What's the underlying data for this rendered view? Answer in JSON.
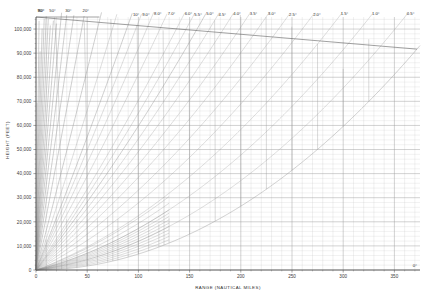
{
  "chart_data": {
    "type": "line",
    "title": "",
    "xlabel": "RANGE (NAUTICAL MILES)",
    "ylabel": "HEIGHT (FEET)",
    "xlim": [
      0,
      375
    ],
    "ylim": [
      0,
      105000
    ],
    "grid": true,
    "legend": "none",
    "xticks": [
      0,
      50,
      100,
      150,
      200,
      250,
      300,
      350
    ],
    "xticklabels": [
      "0",
      "50",
      "100",
      "150",
      "200",
      "250",
      "300",
      "350"
    ],
    "yticks": [
      0,
      10000,
      20000,
      30000,
      40000,
      50000,
      60000,
      70000,
      80000,
      90000,
      100000
    ],
    "yticklabels": [
      "0",
      "10,000",
      "20,000",
      "30,000",
      "40,000",
      "50,000",
      "60,000",
      "70,000",
      "80,000",
      "90,000",
      "100,000"
    ],
    "x_minor_step": 10,
    "y_minor_step": 2000,
    "elevation_angle_unit": "degrees",
    "elevation_rays_deg": [
      0,
      0.5,
      1.0,
      1.5,
      2.0,
      2.5,
      3.0,
      3.5,
      4.0,
      4.5,
      5.0,
      5.5,
      6.0,
      7.0,
      8.0,
      9.0,
      10.0,
      12.0,
      15.0,
      20.0,
      25.0,
      30.0,
      35.0,
      40.0,
      45.0,
      50.0,
      55.0,
      60.0,
      65.0,
      70.0,
      75.0,
      80.0,
      85.0,
      90.0
    ],
    "labeled_angles": [
      {
        "deg": 90,
        "label": "90°"
      },
      {
        "deg": 80,
        "label": "80°"
      },
      {
        "deg": 50,
        "label": "50°"
      },
      {
        "deg": 30,
        "label": "30°"
      },
      {
        "deg": 20,
        "label": "20°"
      },
      {
        "deg": 10,
        "label": "10°"
      },
      {
        "deg": 9,
        "label": "9.0°"
      },
      {
        "deg": 8,
        "label": "8.0°"
      },
      {
        "deg": 7,
        "label": "7.0°"
      },
      {
        "deg": 6,
        "label": "6.0°"
      },
      {
        "deg": 5.5,
        "label": "5.5°"
      },
      {
        "deg": 5,
        "label": "5.0°"
      },
      {
        "deg": 4.5,
        "label": "4.5°"
      },
      {
        "deg": 4,
        "label": "4.0°"
      },
      {
        "deg": 3.5,
        "label": "3.5°"
      },
      {
        "deg": 3,
        "label": "3.0°"
      },
      {
        "deg": 2.5,
        "label": "2.5°"
      },
      {
        "deg": 2,
        "label": "2.0°"
      },
      {
        "deg": 1.5,
        "label": "1.5°"
      },
      {
        "deg": 1,
        "label": "1.0°"
      },
      {
        "deg": 0.5,
        "label": "0.5°"
      },
      {
        "deg": 0,
        "label": "0°"
      }
    ],
    "slant_range_arcs_nmi": [
      25,
      50,
      75,
      100,
      125,
      150,
      175,
      200,
      225,
      250,
      275,
      300,
      325,
      350
    ],
    "radial_vertical_grid_step_nmi": 10,
    "low_angle_fan_deg": [
      0.1,
      0.2,
      0.3,
      0.4,
      0.5,
      0.6,
      0.7,
      0.8,
      0.9,
      1.0,
      1.2,
      1.4
    ],
    "earth_radius_factor": 1.3333
  },
  "axes": {
    "x_axis_title": "RANGE (NAUTICAL MILES)",
    "y_axis_title": "HEIGHT (FEET)"
  },
  "colors": {
    "grid": "#9a9a9a",
    "minor_grid": "#c4c4c4",
    "axis": "#4a4a4a",
    "ray": "#8e8e8e",
    "text": "#2b2b2b",
    "background": "#ffffff"
  }
}
